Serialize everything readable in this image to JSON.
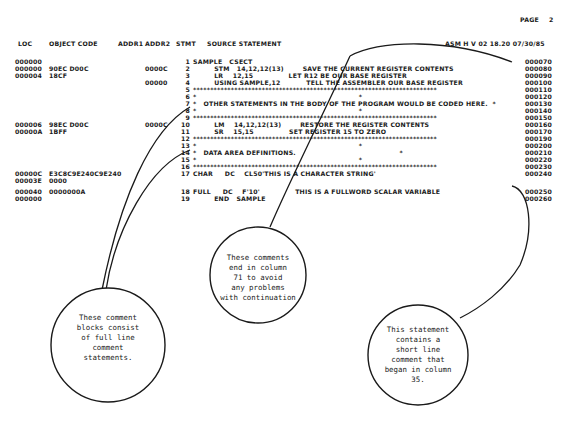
{
  "page_header": {
    "label": "PAGE",
    "number": "2"
  },
  "column_headers": {
    "loc": "LOC",
    "object_code": "OBJECT CODE",
    "addr1": "ADDR1",
    "addr2": "ADDR2",
    "stmt": "STMT",
    "source": "SOURCE STATEMENT",
    "assembler": "ASM H V 02 18.20 07/30/85"
  },
  "listing": [
    {
      "loc": "000000",
      "obj": "",
      "addr2": "",
      "stmt": "1",
      "src": "SAMPLE   CSECT",
      "seq": "000070"
    },
    {
      "loc": "000000",
      "obj": "90EC D00C",
      "addr2": "0000C",
      "stmt": "2",
      "src": "         STM   14,12,12(13)        SAVE THE CURRENT REGISTER CONTENTS",
      "seq": "000080"
    },
    {
      "loc": "000004",
      "obj": "18CF",
      "addr2": "",
      "stmt": "3",
      "src": "         LR    12,15               LET R12 BE OUR BASE REGISTER",
      "seq": "000090"
    },
    {
      "loc": "",
      "obj": "",
      "addr2": "00000",
      "stmt": "4",
      "src": "         USING SAMPLE,12           TELL THE ASSEMBLER OUR BASE REGISTER",
      "seq": "000100"
    },
    {
      "loc": "",
      "obj": "",
      "addr2": "",
      "stmt": "5",
      "src": "***********************************************************************",
      "seq": "000110"
    },
    {
      "loc": "",
      "obj": "",
      "addr2": "",
      "stmt": "6",
      "src": "*                                                                     *",
      "seq": "000120"
    },
    {
      "loc": "",
      "obj": "",
      "addr2": "",
      "stmt": "7",
      "src": "*   OTHER STATEMENTS IN THE BODY OF THE PROGRAM WOULD BE CODED HERE.  *",
      "seq": "000130"
    },
    {
      "loc": "",
      "obj": "",
      "addr2": "",
      "stmt": "8",
      "src": "*                                                                     *",
      "seq": "000140"
    },
    {
      "loc": "",
      "obj": "",
      "addr2": "",
      "stmt": "9",
      "src": "***********************************************************************",
      "seq": "000150"
    },
    {
      "loc": "000006",
      "obj": "98EC D00C",
      "addr2": "0000C",
      "stmt": "10",
      "src": "         LM    14,12,12(13)        RESTORE THE REGISTER CONTENTS",
      "seq": "000160"
    },
    {
      "loc": "00000A",
      "obj": "1BFF",
      "addr2": "",
      "stmt": "11",
      "src": "         SR    15,15               SET REGISTER 15 TO ZERO",
      "seq": "000170"
    },
    {
      "loc": "",
      "obj": "",
      "addr2": "",
      "stmt": "12",
      "src": "***********************************************************************",
      "seq": "000190"
    },
    {
      "loc": "",
      "obj": "",
      "addr2": "",
      "stmt": "13",
      "src": "*                                                                     *",
      "seq": "000200"
    },
    {
      "loc": "",
      "obj": "",
      "addr2": "",
      "stmt": "14",
      "src": "*   DATA AREA DEFINITIONS.                                            *",
      "seq": "000210"
    },
    {
      "loc": "",
      "obj": "",
      "addr2": "",
      "stmt": "15",
      "src": "*                                                                     *",
      "seq": "000220"
    },
    {
      "loc": "",
      "obj": "",
      "addr2": "",
      "stmt": "16",
      "src": "***********************************************************************",
      "seq": "000230"
    },
    {
      "loc": "00000C",
      "obj": "E3C8C9E240C9E240",
      "addr2": "",
      "stmt": "17",
      "src": "CHAR     DC    CL50'THIS IS A CHARACTER STRING'",
      "seq": "000240"
    },
    {
      "loc": "00003E",
      "obj": "0000",
      "addr2": "",
      "stmt": "",
      "src": "",
      "seq": ""
    },
    {
      "loc": "000040",
      "obj": "0000000A",
      "addr2": "",
      "stmt": "18",
      "src": "FULL     DC    F'10'               THIS IS A FULLWORD SCALAR VARIABLE",
      "seq": "000250"
    },
    {
      "loc": "000000",
      "obj": "",
      "addr2": "",
      "stmt": "19",
      "src": "         END   SAMPLE",
      "seq": "000260"
    }
  ],
  "callouts": {
    "column71": [
      "These comments",
      "end in column",
      "71 to avoid",
      "any problems",
      "with continuation"
    ],
    "comment_blocks": [
      "These comment",
      "blocks consist",
      "of full line",
      "comment",
      "statements."
    ],
    "short_comment": [
      "This statement",
      "contains a",
      "short line",
      "comment that",
      "began in column",
      "35."
    ]
  }
}
